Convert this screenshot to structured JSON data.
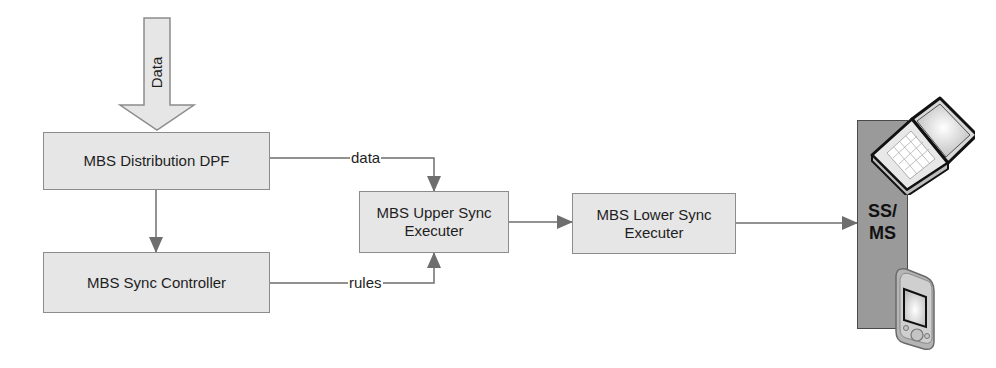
{
  "diagram": {
    "input_arrow": {
      "label": "Data",
      "fill": "#e6e6e6",
      "stroke": "#8c8c8c"
    },
    "nodes": [
      {
        "id": "distribution",
        "label": "MBS Distribution DPF"
      },
      {
        "id": "controller",
        "label": "MBS Sync Controller"
      },
      {
        "id": "upper",
        "label_line1": "MBS Upper Sync",
        "label_line2": "Executer"
      },
      {
        "id": "lower",
        "label_line1": "MBS Lower Sync",
        "label_line2": "Executer"
      }
    ],
    "edges": [
      {
        "from": "Data",
        "to": "MBS Distribution DPF",
        "label": ""
      },
      {
        "from": "MBS Distribution DPF",
        "to": "MBS Sync Controller",
        "label": ""
      },
      {
        "from": "MBS Distribution DPF",
        "to": "MBS Upper Sync Executer",
        "label": "data"
      },
      {
        "from": "MBS Sync Controller",
        "to": "MBS Upper Sync Executer",
        "label": "rules"
      },
      {
        "from": "MBS Upper Sync Executer",
        "to": "MBS Lower Sync Executer",
        "label": ""
      },
      {
        "from": "MBS Lower Sync Executer",
        "to": "SS/MS",
        "label": ""
      }
    ],
    "edge_labels": {
      "data": "data",
      "rules": "rules"
    },
    "terminal": {
      "label_line1": "SS/",
      "label_line2": "MS",
      "bar_color": "#9a9a9a",
      "devices": [
        "laptop-icon",
        "pda-icon"
      ]
    },
    "colors": {
      "box_fill": "#e6e6e6",
      "box_border": "#8c8c8c",
      "line": "#6e6e6e",
      "arrowhead": "#6e6e6e"
    }
  }
}
